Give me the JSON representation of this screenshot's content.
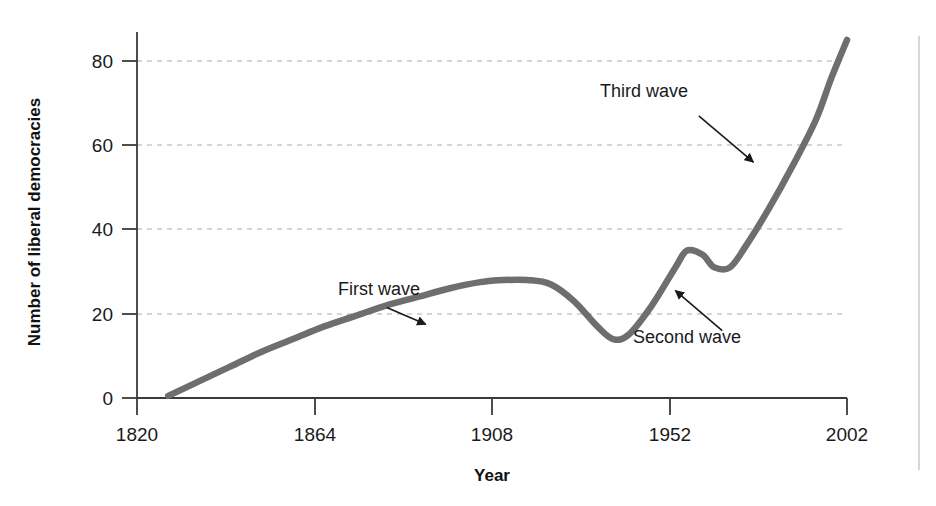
{
  "chart_data": {
    "type": "line",
    "title": "",
    "subtitle": "",
    "xlabel": "Year",
    "ylabel": "Number of liberal democracies",
    "xlim": [
      1820,
      2002
    ],
    "ylim": [
      0,
      88
    ],
    "xticks": [
      "1820",
      "1864",
      "1908",
      "1952",
      "2002"
    ],
    "xtick_values": [
      1820,
      1864,
      1908,
      1952,
      2002
    ],
    "yticks": [
      "0",
      "20",
      "40",
      "60",
      "80"
    ],
    "ytick_values": [
      0,
      20,
      40,
      60,
      80
    ],
    "grid": "horizontal-dashed",
    "legend": "none",
    "line_color": "#6e6e6e",
    "axis_color": "#3a3a3a",
    "grid_color": "#c8c8c8",
    "series": [
      {
        "name": "Number of liberal democracies",
        "x": [
          1828,
          1836,
          1844,
          1852,
          1860,
          1868,
          1876,
          1884,
          1892,
          1900,
          1908,
          1914,
          1920,
          1926,
          1932,
          1938,
          1942,
          1946,
          1952,
          1958,
          1961,
          1965,
          1968,
          1972,
          1976,
          1982,
          1988,
          1994,
          1998,
          2002
        ],
        "y": [
          0.5,
          4,
          7.5,
          11,
          14,
          17,
          19.5,
          22,
          24,
          26,
          27.5,
          28,
          28,
          27,
          23,
          17,
          14,
          15,
          22,
          31,
          35,
          34,
          31,
          31,
          36,
          45,
          55,
          66,
          76,
          85
        ]
      }
    ],
    "annotations": [
      {
        "id": "first-wave",
        "label": "First wave",
        "text_x": 1882,
        "text_y": 24.5,
        "arrow_from_x": 1884,
        "arrow_from_y": 21.5,
        "arrow_to_x": 1894,
        "arrow_to_y": 17.5
      },
      {
        "id": "second-wave",
        "label": "Second wave",
        "text_x": 1961,
        "text_y": 13.0,
        "arrow_from_x": 1970,
        "arrow_from_y": 16.0,
        "arrow_to_x": 1958,
        "arrow_to_y": 25.5
      },
      {
        "id": "third-wave",
        "label": "Third wave",
        "text_x": 1950,
        "text_y": 71.5,
        "arrow_from_x": 1964,
        "arrow_from_y": 67.0,
        "arrow_to_x": 1978,
        "arrow_to_y": 56.0
      }
    ]
  },
  "figure": {
    "alt": "Line chart of the number of liberal democracies by year, 1820 to 2002, showing three waves of democratization"
  }
}
